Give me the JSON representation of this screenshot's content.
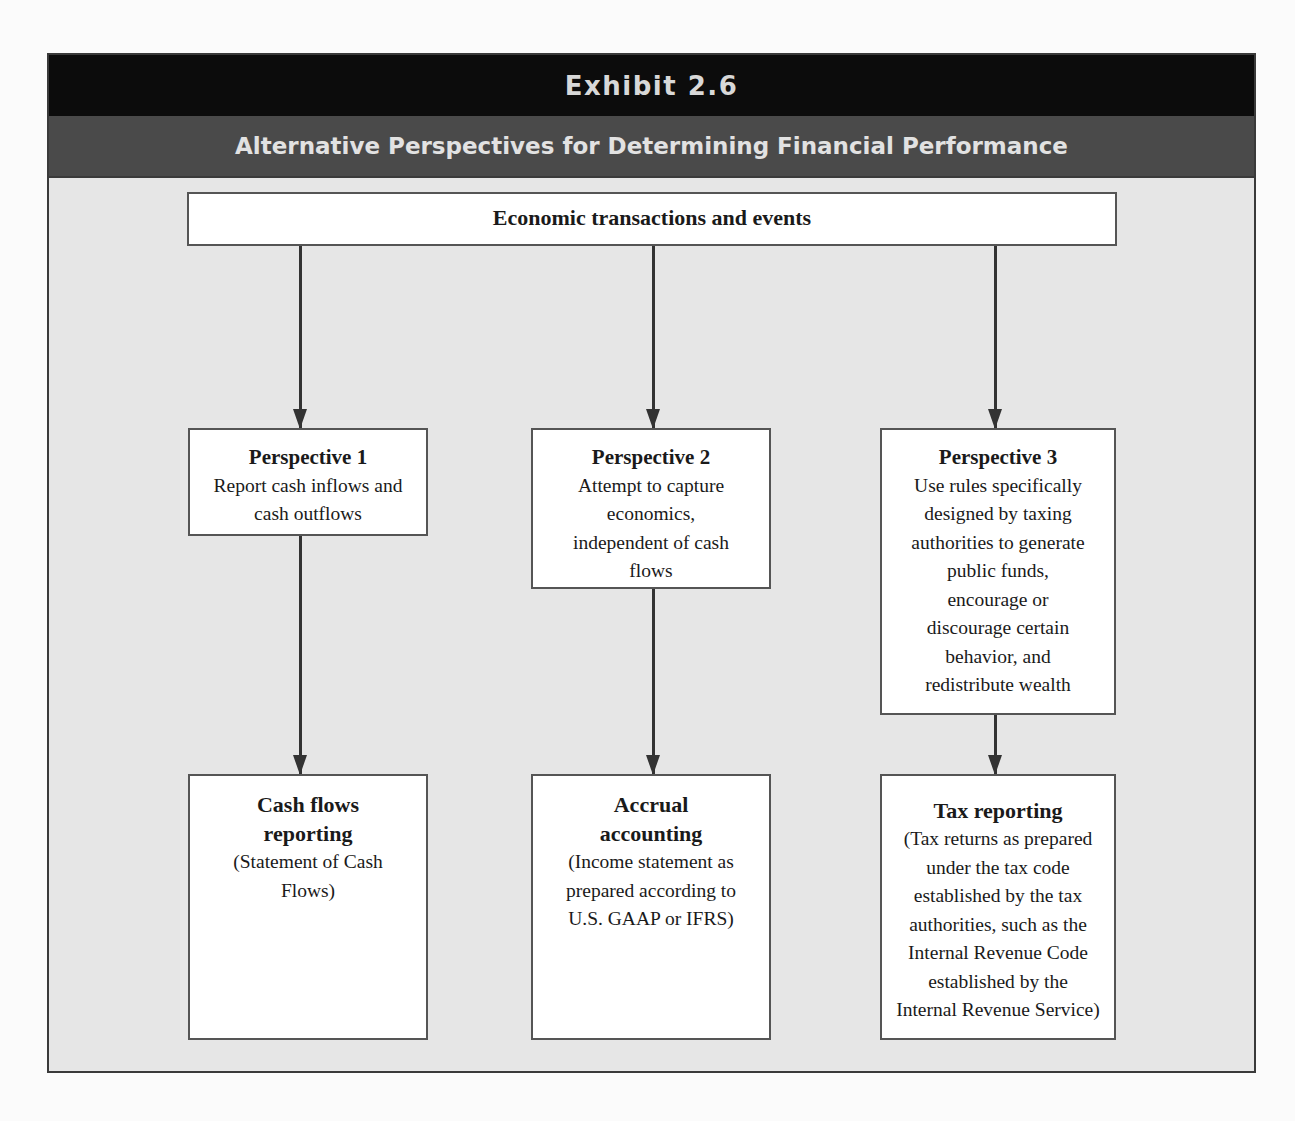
{
  "exhibit": {
    "label": "Exhibit 2.6",
    "title": "Alternative Perspectives for Determining Financial Performance"
  },
  "source": {
    "label": "Economic transactions and events"
  },
  "perspectives": [
    {
      "heading": "Perspective 1",
      "lines": [
        "Report cash inflows and",
        "cash outflows"
      ]
    },
    {
      "heading": "Perspective 2",
      "lines": [
        "Attempt to capture",
        "economics,",
        "independent of cash",
        "flows"
      ]
    },
    {
      "heading": "Perspective 3",
      "lines": [
        "Use rules specifically",
        "designed by taxing",
        "authorities to generate",
        "public funds,",
        "encourage or",
        "discourage certain",
        "behavior, and",
        "redistribute wealth"
      ]
    }
  ],
  "outcomes": [
    {
      "heading_lines": [
        "Cash flows",
        "reporting"
      ],
      "lines": [
        "(Statement of Cash",
        "Flows)"
      ]
    },
    {
      "heading_lines": [
        "Accrual",
        "accounting"
      ],
      "lines": [
        "(Income statement as",
        "prepared according to",
        "U.S. GAAP or IFRS)"
      ]
    },
    {
      "heading_lines": [
        "Tax reporting"
      ],
      "lines": [
        "(Tax returns as prepared",
        "under the tax code",
        "established by the tax",
        "authorities, such as the",
        "Internal Revenue Code",
        "established by the",
        "Internal Revenue Service)"
      ]
    }
  ],
  "colors": {
    "exhibit_bar": "#0c0c0c",
    "title_bar": "#4a4a4a",
    "panel": "#e6e6e6",
    "box": "#ffffff",
    "stroke": "#333333"
  }
}
